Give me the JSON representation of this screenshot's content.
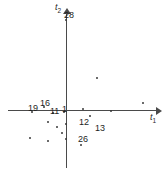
{
  "chart_data": {
    "type": "scatter",
    "title": "",
    "xlabel": "t1",
    "ylabel": "t2",
    "xlabel_display": "t",
    "xlabel_sub": "1",
    "ylabel_display": "t",
    "ylabel_sub": "2",
    "grid": false,
    "legend": "none",
    "axes": {
      "origin_px": [
        66,
        111
      ],
      "x_axis_px": {
        "x1": 8,
        "x2": 158,
        "y": 111
      },
      "y_axis_px": {
        "y1": 14,
        "y2": 168,
        "x": 66
      }
    },
    "labeled_points": [
      {
        "label": "19",
        "px": [
          28,
          104
        ],
        "dot_px": [
          32,
          112
        ],
        "quadrant": "left-on-axis"
      },
      {
        "label": "16",
        "px": [
          40,
          99
        ],
        "dot_px": [
          44,
          107
        ],
        "quadrant": "upper-left"
      },
      {
        "label": "11",
        "px": [
          50,
          107
        ],
        "dot_px": [
          53,
          113
        ],
        "quadrant": "left-on-axis"
      },
      {
        "label": "1",
        "px": [
          62,
          105
        ],
        "dot_px": [
          64,
          112
        ],
        "quadrant": "left-on-axis"
      },
      {
        "label": "28",
        "px": [
          64,
          11
        ],
        "dot_px": [
          66,
          20
        ],
        "quadrant": "top-axis"
      },
      {
        "label": "12",
        "px": [
          79,
          118
        ],
        "dot_px": [
          83,
          109
        ],
        "quadrant": "lower-right"
      },
      {
        "label": "13",
        "px": [
          95,
          124
        ],
        "dot_px": [
          90,
          116
        ],
        "quadrant": "lower-right"
      },
      {
        "label": "26",
        "px": [
          78,
          135
        ],
        "dot_px": [
          81,
          145
        ],
        "quadrant": "lower-right"
      }
    ],
    "unlabeled_points": [
      {
        "px": [
          97,
          78
        ]
      },
      {
        "px": [
          143,
          103
        ]
      },
      {
        "px": [
          111,
          111
        ]
      },
      {
        "px": [
          66,
          124
        ]
      },
      {
        "px": [
          57,
          127
        ]
      },
      {
        "px": [
          48,
          122
        ]
      },
      {
        "px": [
          62,
          133
        ]
      },
      {
        "px": [
          48,
          141
        ]
      },
      {
        "px": [
          30,
          138
        ]
      },
      {
        "px": [
          66,
          139
        ]
      }
    ]
  }
}
